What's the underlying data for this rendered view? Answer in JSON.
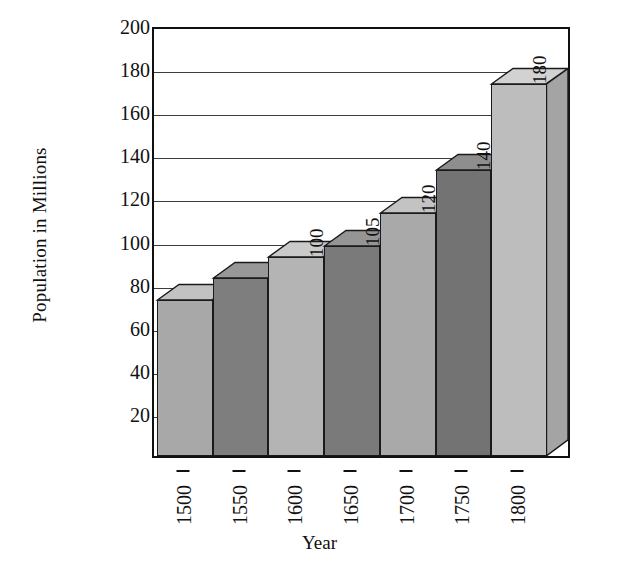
{
  "chart_data": {
    "type": "bar",
    "title": "",
    "xlabel": "Year",
    "ylabel": "Population in Millions",
    "categories": [
      "1500",
      "1550",
      "1600",
      "1650",
      "1700",
      "1750",
      "1800"
    ],
    "values": [
      80,
      90,
      100,
      105,
      120,
      140,
      180
    ],
    "bar_labels": [
      "",
      "",
      "100",
      "105",
      "120",
      "140",
      "180"
    ],
    "ylim": [
      0,
      200
    ],
    "yticks": [
      20,
      40,
      60,
      80,
      100,
      120,
      140,
      160,
      180,
      200
    ],
    "grid": true,
    "legend": "none",
    "style": "3d-bar",
    "bar_colors": [
      "#a8a8a8",
      "#7e7e7e",
      "#b4b4b4",
      "#7a7a7a",
      "#a9a9a9",
      "#737373",
      "#bdbdbd"
    ],
    "bar_top_colors": [
      "#c2c2c2",
      "#989898",
      "#cacaca",
      "#959595",
      "#c3c3c3",
      "#8e8e8e",
      "#d2d2d2"
    ],
    "bar_side_colors": [
      "#8e8e8e",
      "#6a6a6a",
      "#9a9a9a",
      "#666666",
      "#909090",
      "#606060",
      "#a4a4a4"
    ],
    "axis_color": "#111111",
    "grid_color": "#3c3c3c",
    "background": "#ffffff"
  }
}
